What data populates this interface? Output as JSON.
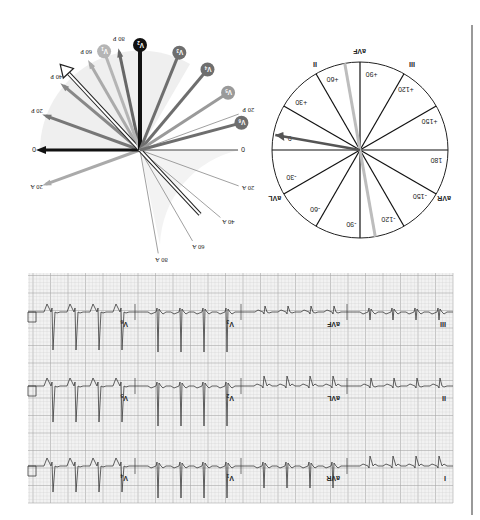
{
  "figure": {
    "orientation": "rotated-180",
    "colors": {
      "background": "#ffffff",
      "grid_minor": "#cfcfcf",
      "grid_major": "#a8a8a8",
      "grid_bg": "#f2f2f2",
      "trace": "#3a3a3a",
      "black": "#111111",
      "dark_gray": "#555555",
      "mid_gray": "#7a7a7a",
      "light_gray": "#b0b0b0",
      "shade": "#ececec",
      "divider": "#777777"
    }
  },
  "vector_diagram": {
    "axis_zero_labels": [
      "0",
      "0"
    ],
    "tick_labels_A": [
      "20 A",
      "40 A",
      "60 A",
      "80 A"
    ],
    "tick_labels_P": [
      "20 P",
      "40 P",
      "60 P",
      "80 P"
    ],
    "tick_labels_A_left": [
      "20 A"
    ],
    "tick_labels_P_left": [
      "20 P",
      "40 P",
      "60 P",
      "80 P"
    ],
    "leads": [
      {
        "label": "V1",
        "sub": "1",
        "angle_deg": 70,
        "shade": "light"
      },
      {
        "label": "V2",
        "sub": "2",
        "angle_deg": 90,
        "shade": "black"
      },
      {
        "label": "V3",
        "sub": "3",
        "angle_deg": 112,
        "shade": "dark"
      },
      {
        "label": "V4",
        "sub": "4",
        "angle_deg": 130,
        "shade": "dark"
      },
      {
        "label": "V5",
        "sub": "5",
        "angle_deg": 147,
        "shade": "mid"
      },
      {
        "label": "V6",
        "sub": "6",
        "angle_deg": 165,
        "shade": "dark"
      }
    ],
    "lead_names": [
      "V",
      "V",
      "V",
      "V",
      "V",
      "V"
    ]
  },
  "hexaxial": {
    "lead_labels": [
      "I",
      "II",
      "III",
      "aVR",
      "aVL",
      "aVF"
    ],
    "label_II": "II",
    "label_III": "III",
    "label_aVF": "aVF",
    "label_aVR": "aVR",
    "label_aVL": "aVL",
    "degree_labels": {
      "d0": "0",
      "d30p": "+30",
      "d60p": "+60",
      "d90p": "+90",
      "d120p": "+120",
      "d150p": "+150",
      "d180": "180",
      "d30m": "-30",
      "d60m": "-60",
      "d90m": "-90",
      "d120m": "-120",
      "d150m": "-150"
    },
    "axis_arrow_deg": 10,
    "gray_line_deg": 80
  },
  "ecg": {
    "rows": [
      {
        "labels": [
          "I",
          "aVR",
          "V1",
          "V4"
        ]
      },
      {
        "labels": [
          "II",
          "aVL",
          "V2",
          "V5"
        ]
      },
      {
        "labels": [
          "III",
          "aVF",
          "V3",
          "V6"
        ]
      }
    ],
    "lead_I": "I",
    "lead_II": "II",
    "lead_III": "III",
    "lead_aVR": "aVR",
    "lead_aVL": "aVL",
    "lead_aVF": "aVF",
    "lead_V1": "V",
    "lead_V1_sub": "1",
    "lead_V2": "V",
    "lead_V2_sub": "2",
    "lead_V3": "V",
    "lead_V3_sub": "3",
    "lead_V4": "V",
    "lead_V4_sub": "4",
    "lead_V5": "V",
    "lead_V5_sub": "5",
    "lead_V6": "V",
    "lead_V6_sub": "6"
  }
}
